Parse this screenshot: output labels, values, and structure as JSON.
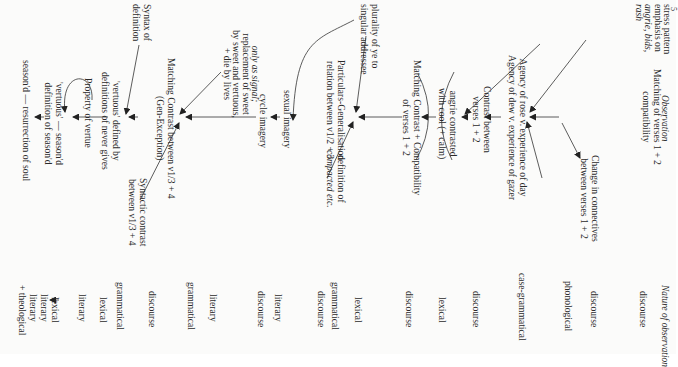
{
  "page": {
    "page_number_fragment": "5",
    "headers": {
      "observation": "Observation",
      "nature": "Nature of observation"
    }
  },
  "nodes": {
    "matching_v12_compat": [
      "Matching of verses 1 + 2",
      "compatibility"
    ],
    "change_connectives": [
      "Change in connectives",
      "between verses 1 + 2"
    ],
    "stress_pattern": [
      "stress pattern",
      "emphasis on",
      "angrie, bids,",
      "rash"
    ],
    "agency": [
      "Agency of rose v. experience of day",
      "Agency of dew v. experience of gazer"
    ],
    "contrast_v12": [
      "Contrast between",
      "verses 1 + 2"
    ],
    "angrie_contrasted": [
      "angrie contrasted",
      "with cool (+ calm)"
    ],
    "matching_contrast_compat": [
      "Matching Contrast + Compatibility",
      "of verses 1 + 2"
    ],
    "plurality": [
      "plurality of ye to",
      "singular addressee"
    ],
    "definition_compacted": [
      "definition of",
      "compacted etc."
    ],
    "particulars_generalisation": [
      "Particulars-Generalisation",
      "relation between v1/2 + 3"
    ],
    "sexual_imagery": [
      "sexual imagery"
    ],
    "cycle_imagery": [
      "cycle imagery"
    ],
    "only_as_signal": [
      "only as signal;",
      "replacement of sweet",
      "by sweet and vertuous,",
      "+ die by lives"
    ],
    "matching_contrast_gen_exc": [
      "Matching Contrast between v1/3 + 4",
      "(Gen-Exception)"
    ],
    "syntactic_contrast": [
      "Syntactic contrast",
      "between v1/3 + 4"
    ],
    "syntax_definition": [
      "Syntax of",
      "definition"
    ],
    "vertuous_defined": [
      "'vertuous' defined by",
      "definitions of never gives"
    ],
    "property_vertue": [
      "Property of vertue"
    ],
    "vertuous_season": [
      "'vertuous' — season'd",
      "definition of season'd"
    ],
    "season_resurrection": [
      "season'd — resurrection of soul"
    ]
  },
  "nature_column": [
    "discourse",
    "discourse",
    "phonological",
    "case-grammatical",
    "discourse",
    "lexical",
    "discourse",
    "lexical",
    "grammatical",
    "discourse",
    "literary",
    "discourse",
    "literary",
    "grammatical",
    "discourse",
    "grammatical",
    "lexical",
    "literary",
    "lexical",
    "literary",
    "literary",
    "+ theological"
  ]
}
